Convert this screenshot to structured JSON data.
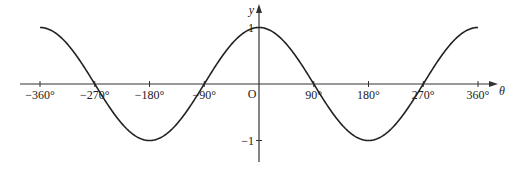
{
  "chart_data": {
    "type": "line",
    "title": "",
    "function": "y = cos θ",
    "xlabel": "θ",
    "ylabel": "y",
    "origin_label": "O",
    "xlim": [
      -360,
      360
    ],
    "ylim": [
      -1,
      1
    ],
    "x_ticks": [
      -360,
      -270,
      -180,
      -90,
      90,
      180,
      270,
      360
    ],
    "x_tick_labels": [
      "−360°",
      "−270°",
      "−180°",
      "−90°",
      "90°",
      "180°",
      "270°",
      "360°"
    ],
    "y_ticks": [
      1,
      -1
    ],
    "y_tick_labels": [
      "1",
      "−1"
    ],
    "grid": false,
    "legend": null,
    "series": [
      {
        "name": "cos θ",
        "x": [
          -360,
          -270,
          -180,
          -90,
          0,
          90,
          180,
          270,
          360
        ],
        "values": [
          1,
          0,
          -1,
          0,
          1,
          0,
          -1,
          0,
          1
        ]
      }
    ],
    "colors": {
      "curve": "#222222",
      "axes": "#333333"
    }
  }
}
